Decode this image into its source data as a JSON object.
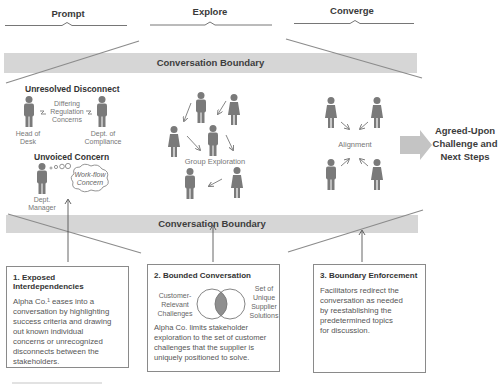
{
  "phases": [
    {
      "label": "Prompt"
    },
    {
      "label": "Explore"
    },
    {
      "label": "Converge"
    }
  ],
  "boundary_top": {
    "label": "Conversation Boundary"
  },
  "boundary_bottom": {
    "label": "Conversation Boundary"
  },
  "prompt_section": {
    "unresolved_title": "Unresolved Disconnect",
    "differing_label": "Differing Regulation Concerns",
    "differing_lines": [
      "Differing",
      "Regulation",
      "Concerns"
    ],
    "head_of_desk": [
      "Head of",
      "Desk"
    ],
    "dept_compliance": [
      "Dept. of",
      "Compliance"
    ],
    "unvoiced_title": "Unvoiced Concern",
    "cloud_lines": [
      "Work-flow",
      "Concern"
    ],
    "dept_manager": [
      "Dept.",
      "Manager"
    ]
  },
  "explore_section": {
    "label": "Group Exploration"
  },
  "converge_section": {
    "label": "Alignment"
  },
  "outcome": {
    "lines": [
      "Agreed-Upon",
      "Challenge and",
      "Next Steps"
    ]
  },
  "boxes": [
    {
      "title": "1. Exposed Interdependencies",
      "body_lines": [
        "Alpha Co.¹ eases into a",
        "conversation by highlighting",
        "success criteria and drawing",
        "out known individual",
        "concerns or unrecognized",
        "disconnects between the",
        "stakeholders."
      ]
    },
    {
      "title": "2. Bounded Conversation",
      "venn_left": [
        "Customer-",
        "Relevant",
        "Challenges"
      ],
      "venn_right": [
        "Set of",
        "Unique",
        "Supplier",
        "Solutions"
      ],
      "body_lines": [
        "Alpha Co. limits stakeholder",
        "exploration to the set of customer",
        "challenges that the supplier is",
        "uniquely positioned to solve."
      ]
    },
    {
      "title": "3. Boundary Enforcement",
      "body_lines": [
        "Facilitators redirect the",
        "conversation as needed",
        "by reestablishing the",
        "predetermined topics",
        "for discussion."
      ]
    }
  ],
  "colors": {
    "band": "#d6d6d6",
    "figure": "#7a7a7a",
    "line": "#8c8c8c",
    "arrow_fill": "#c4c4c4",
    "venn_overlap": "#8f8f8f"
  }
}
